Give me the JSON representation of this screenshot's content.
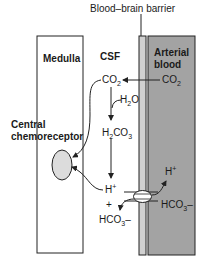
{
  "diagram": {
    "title_label": "Blood–brain barrier",
    "regions": {
      "medulla": "Medulla",
      "csf": "CSF",
      "arterial_line1": "Arterial",
      "arterial_line2": "blood"
    },
    "receptor": {
      "line1": "Central",
      "line2": "chemoreceptor"
    },
    "species": {
      "co2_blood": {
        "base": "CO",
        "sub": "2"
      },
      "co2_csf": {
        "base": "CO",
        "sub": "2"
      },
      "h2o": {
        "pre": "H",
        "sub": "2",
        "post": "O"
      },
      "h2co3": {
        "pre": "H",
        "sub1": "2",
        "mid": "CO",
        "sub2": "3"
      },
      "h_csf": {
        "base": "H",
        "sup": "+"
      },
      "plus": "+",
      "hco3_csf": {
        "base": "HCO",
        "sub": "3",
        "sup": "–"
      },
      "h_blood": {
        "base": "H",
        "sup": "+"
      },
      "hco3_blood": {
        "base": "HCO",
        "sub": "3",
        "sup": "–"
      }
    },
    "colors": {
      "arterial_fill": "#a3a3a3",
      "barrier_fill": "#d0d0d0",
      "receptor_fill": "#dcdcdc",
      "stroke": "#222222"
    }
  }
}
